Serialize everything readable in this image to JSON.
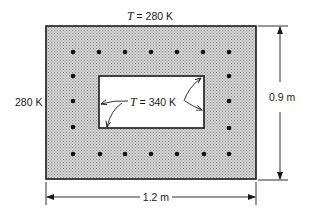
{
  "labels": {
    "top_temp_var": "T",
    "top_temp_val": " = 280 K",
    "left_temp": "280 K",
    "inner_temp_var": "T",
    "inner_temp_val": " = 340 K",
    "height_dim": "0.9 m",
    "width_dim": "1.2 m"
  },
  "colors": {
    "outline": "#1a1a1a",
    "fill": "#c8c8c8",
    "inner_fill": "#ffffff",
    "dot": "#111111"
  },
  "geometry": {
    "outer": {
      "x": 46,
      "y": 26,
      "w": 210,
      "h": 153
    },
    "inner": {
      "x": 99,
      "y": 76,
      "w": 105,
      "h": 52
    },
    "dot_columns": [
      73,
      99,
      125,
      151,
      177,
      203,
      229
    ],
    "dot_rows_full": [
      52,
      154
    ],
    "dot_side_rows": [
      76,
      101,
      127
    ]
  }
}
